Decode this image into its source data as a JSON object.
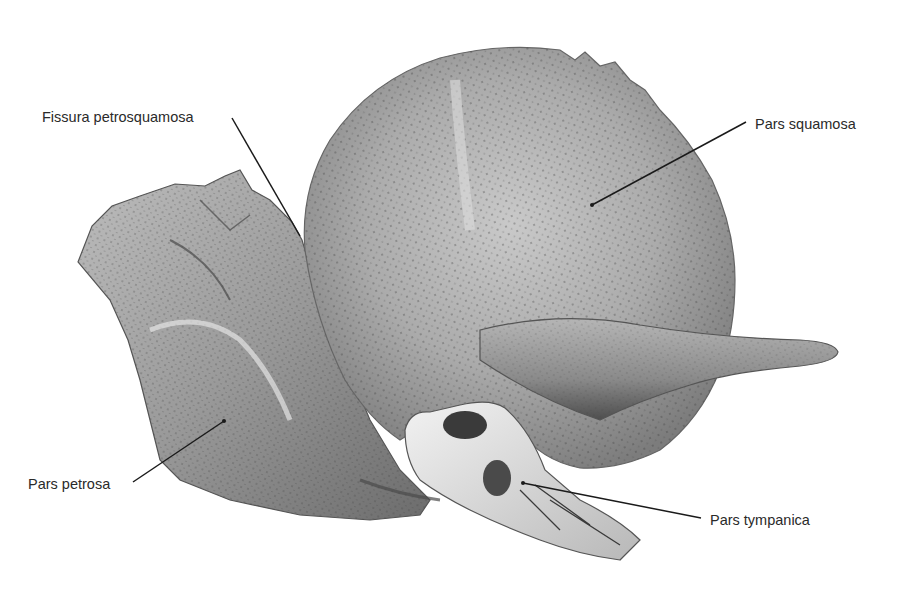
{
  "figure": {
    "background": "#ffffff",
    "bone_colors": {
      "base": "#a9a9a9",
      "light": "#d8d8d8",
      "dark": "#5a5a5a",
      "pore": "#3c3c3c",
      "tympanic": "#e6e6e6"
    },
    "line_color": "#1a1a1a"
  },
  "labels": [
    {
      "id": "fissura-petrosquamosa",
      "text": "Fissura petrosquamosa",
      "x": 42,
      "y": 110,
      "line": [
        232,
        118,
        300,
        236
      ]
    },
    {
      "id": "pars-squamosa",
      "text": "Pars squamosa",
      "x": 755,
      "y": 117,
      "line": [
        746,
        122,
        592,
        205
      ]
    },
    {
      "id": "pars-petrosa",
      "text": "Pars petrosa",
      "x": 28,
      "y": 477,
      "line": [
        133,
        482,
        224,
        421
      ]
    },
    {
      "id": "pars-tympanica",
      "text": "Pars tympanica",
      "x": 710,
      "y": 513,
      "line": [
        701,
        518,
        523,
        483
      ]
    }
  ]
}
